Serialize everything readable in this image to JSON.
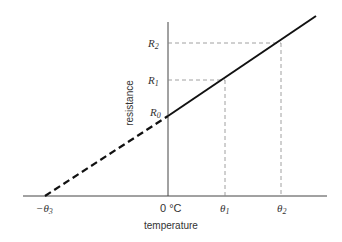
{
  "diagram": {
    "x_axis_label": "temperature",
    "y_axis_label": "resistance",
    "x_ticks": {
      "neg": "−θ",
      "neg_sub": "3",
      "zero": "0 °C",
      "t1": "θ",
      "t1_sub": "1",
      "t2": "θ",
      "t2_sub": "2"
    },
    "y_ticks": {
      "r0": "R",
      "r0_sub": "0",
      "r1": "R",
      "r1_sub": "1",
      "r2": "R",
      "r2_sub": "2"
    },
    "colors": {
      "line": "#111111",
      "axis": "#444444",
      "guide": "#888888"
    }
  }
}
